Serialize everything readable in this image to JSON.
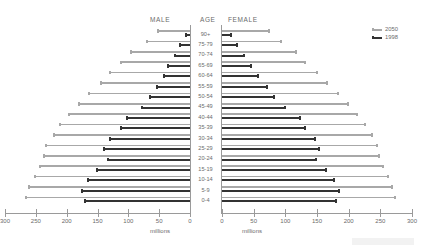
{
  "header": {
    "male": "MALE",
    "age": "AGE",
    "female": "FEMALE"
  },
  "legend": {
    "position": "top-right",
    "items": [
      {
        "label": "2050",
        "color": "#a8a8a8"
      },
      {
        "label": "1998",
        "color": "#333333"
      }
    ]
  },
  "axis": {
    "units": "millions",
    "male_ticks": [
      "300",
      "250",
      "200",
      "150",
      "100",
      "50",
      "0"
    ],
    "female_ticks": [
      "0",
      "50",
      "100",
      "150",
      "200",
      "250",
      "300"
    ],
    "max": 300,
    "min": 0
  },
  "chart_data": {
    "type": "bar",
    "title": "",
    "subtitle": "",
    "xlabel": "millions",
    "ylabel": "AGE",
    "xlim": [
      0,
      300
    ],
    "grid": false,
    "legend_position": "top-right",
    "orientation": "population-pyramid",
    "categories": [
      "90+",
      "75-79",
      "70-74",
      "65-69",
      "60-64",
      "55-59",
      "50-54",
      "45-49",
      "40-44",
      "35-39",
      "30-34",
      "25-29",
      "20-24",
      "15-19",
      "10-14",
      "5-9",
      "0-4"
    ],
    "series": [
      {
        "name": "1998",
        "side": "male",
        "color": "#333333",
        "values": [
          8,
          18,
          26,
          37,
          44,
          55,
          66,
          80,
          103,
          113,
          132,
          141,
          135,
          152,
          167,
          176,
          172
        ]
      },
      {
        "name": "2050",
        "side": "male",
        "color": "#a8a8a8",
        "values": [
          54,
          72,
          98,
          114,
          131,
          146,
          165,
          182,
          198,
          212,
          222,
          235,
          238,
          245,
          253,
          262,
          268
        ]
      },
      {
        "name": "1998",
        "side": "female",
        "color": "#333333",
        "values": [
          16,
          25,
          36,
          47,
          58,
          72,
          84,
          101,
          124,
          133,
          148,
          155,
          150,
          166,
          178,
          186,
          182
        ]
      },
      {
        "name": "2050",
        "side": "female",
        "color": "#a8a8a8",
        "values": [
          75,
          94,
          118,
          133,
          151,
          168,
          185,
          200,
          215,
          228,
          238,
          246,
          250,
          256,
          263,
          270,
          275
        ]
      }
    ]
  }
}
